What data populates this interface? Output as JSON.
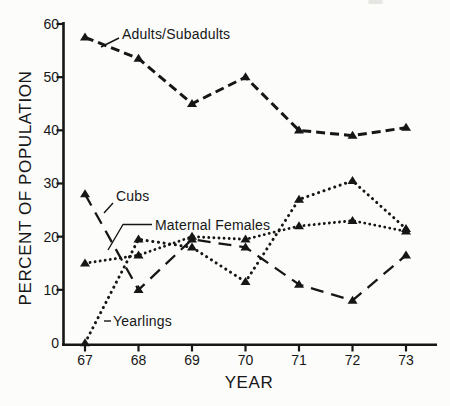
{
  "figure": {
    "background": "#fcfcfa",
    "ink": "#161616"
  },
  "chart_data": {
    "type": "line",
    "title": "",
    "xlabel": "YEAR",
    "ylabel": "PERCENT OF POPULATION",
    "x_ticks": [
      "67",
      "68",
      "69",
      "70",
      "71",
      "72",
      "73"
    ],
    "y_ticks": [
      "0",
      "10",
      "20",
      "30",
      "40",
      "50",
      "60"
    ],
    "ylim": [
      0,
      60
    ],
    "grid": false,
    "legend_position": "inline-callouts",
    "marker": "filled-triangle-up",
    "series": [
      {
        "name": "adults_subadults",
        "label": "Adults/Subadults",
        "line_style": "dashed",
        "marker": "triangle",
        "values": [
          57.5,
          53.5,
          45,
          50,
          40,
          39,
          40.5
        ]
      },
      {
        "name": "cubs",
        "label": "Cubs",
        "line_style": "long-dash",
        "marker": "triangle",
        "values": [
          28,
          10,
          19.5,
          18,
          11,
          8,
          16.5
        ]
      },
      {
        "name": "maternal_females",
        "label": "Maternal Females",
        "line_style": "dotted",
        "marker": "triangle",
        "values": [
          15,
          16.5,
          20,
          19.5,
          22,
          23,
          21
        ]
      },
      {
        "name": "yearlings",
        "label": "Yearlings",
        "line_style": "dotted-fine",
        "marker": "triangle",
        "values": [
          0,
          19.5,
          18,
          11.5,
          27,
          30.5,
          21.5
        ]
      }
    ]
  }
}
